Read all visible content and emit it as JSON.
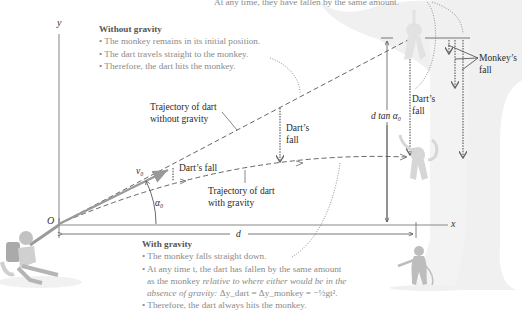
{
  "top_caption": "At any time, they have fallen by the same amount.",
  "axes": {
    "x_label": "x",
    "y_label": "y",
    "origin_label": "O"
  },
  "without_gravity": {
    "heading": "Without gravity",
    "bullets": [
      "• The monkey remains in its initial position.",
      "• The dart travels straight to the monkey.",
      "• Therefore, the dart hits the monkey."
    ]
  },
  "with_gravity": {
    "heading": "With gravity",
    "bullet1": "• The monkey falls straight down.",
    "bullet2_line1": "• At any time t, the dart has fallen by the same amount",
    "bullet2_line2_plain": "as the monkey ",
    "bullet2_line2_italic": "relative to where either would be in the",
    "bullet2_line3_italic": "absence of gravity: ",
    "bullet2_equation": "Δy_dart = Δy_monkey = −½gt².",
    "bullet3": "• Therefore, the dart always hits the monkey."
  },
  "labels": {
    "traj_no_gravity_1": "Trajectory of dart",
    "traj_no_gravity_2": "without gravity",
    "traj_gravity_1": "Trajectory of dart",
    "traj_gravity_2": "with gravity",
    "darts_fall_small": "Dart’s fall",
    "darts_fall_mid_1": "Dart’s",
    "darts_fall_mid_2": "fall",
    "darts_fall_right_1": "Dart’s",
    "darts_fall_right_2": "fall",
    "monkeys_fall_1": "Monkey’s",
    "monkeys_fall_2": "fall",
    "height_label": "d tan α₀",
    "distance_label": "d",
    "velocity_label": "v₀",
    "angle_label": "α₀"
  },
  "colors": {
    "text_gray": "#8a8a8a",
    "line": "#444444",
    "arrow_gray": "#9a9a9a",
    "figure_gray": "#c8c8c8",
    "tree_gray": "#eeeeee"
  }
}
